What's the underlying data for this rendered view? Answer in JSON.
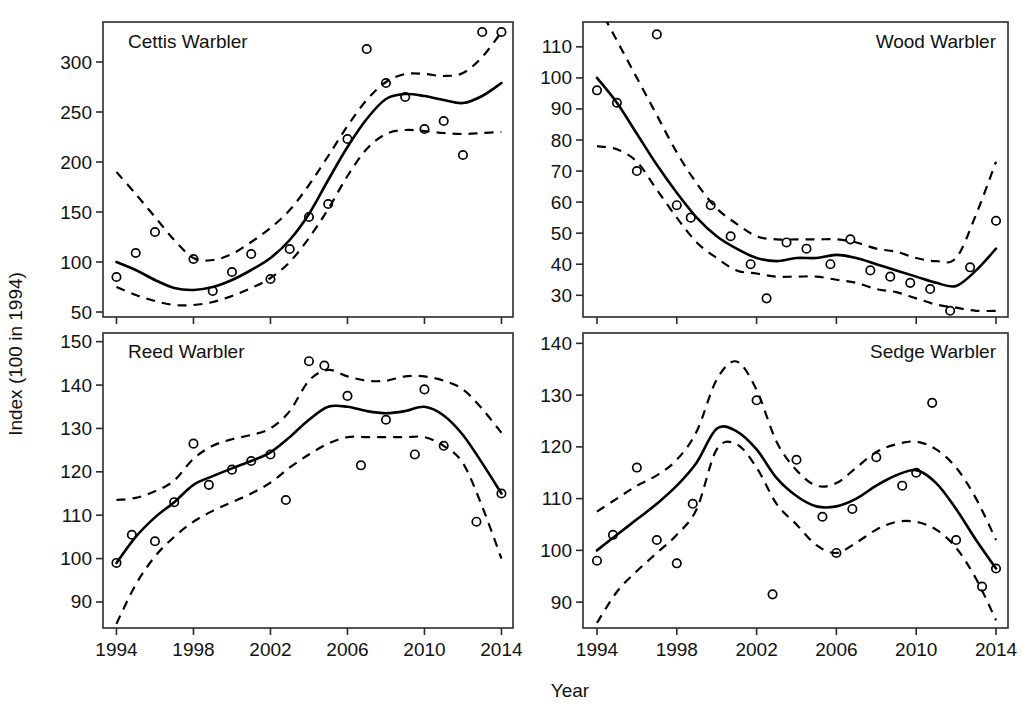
{
  "figure": {
    "xlabel": "Year",
    "ylabel": "Index (100 in 1994)",
    "background": "#ffffff",
    "line_color": "#000000",
    "point_face_color": "#ffffff"
  },
  "chart_data": [
    {
      "type": "line",
      "title": "Cettis Warbler",
      "panel": "top-left",
      "xlabel": "Year",
      "ylabel": "Index (100 in 1994)",
      "xlim": [
        1993.3,
        2014.6
      ],
      "ylim": [
        45,
        340
      ],
      "xticks": [
        1994,
        1998,
        2002,
        2006,
        2010,
        2014
      ],
      "xticklabels": [
        "1994",
        "1998",
        "2002",
        "2006",
        "2010",
        "2014"
      ],
      "yticks": [
        50,
        100,
        150,
        200,
        250,
        300
      ],
      "yticklabels": [
        "50",
        "100",
        "150",
        "200",
        "250",
        "300"
      ],
      "grid": false,
      "legend": "none",
      "series": [
        {
          "name": "observed index",
          "style": "open-circle-markers",
          "x": [
            1994,
            1995,
            1996,
            1998,
            1999,
            2000,
            2001,
            2002,
            2003,
            2004,
            2005,
            2006,
            2007,
            2008,
            2009,
            2010,
            2011,
            2012,
            2013,
            2014
          ],
          "values": [
            85,
            109,
            130,
            103,
            71,
            90,
            108,
            83,
            113,
            145,
            158,
            223,
            313,
            279,
            265,
            233,
            241,
            207,
            330,
            330
          ]
        },
        {
          "name": "smoothed trend",
          "style": "solid-line",
          "x": [
            1994,
            1995,
            1996,
            1997,
            1998,
            1999,
            2000,
            2001,
            2002,
            2003,
            2004,
            2005,
            2006,
            2007,
            2008,
            2009,
            2010,
            2011,
            2012,
            2013,
            2014
          ],
          "values": [
            100,
            92,
            82,
            74,
            72,
            75,
            82,
            92,
            104,
            122,
            148,
            182,
            215,
            243,
            263,
            268,
            266,
            262,
            259,
            266,
            279
          ]
        },
        {
          "name": "upper 95% confidence limit",
          "style": "dashed-line",
          "x": [
            1994,
            1995,
            1996,
            1997,
            1998,
            1999,
            2000,
            2001,
            2002,
            2003,
            2004,
            2005,
            2006,
            2007,
            2008,
            2009,
            2010,
            2011,
            2012,
            2013,
            2014
          ],
          "values": [
            190,
            168,
            145,
            122,
            104,
            102,
            108,
            120,
            134,
            152,
            177,
            206,
            236,
            262,
            280,
            288,
            288,
            286,
            289,
            305,
            330
          ]
        },
        {
          "name": "lower 95% confidence limit",
          "style": "dashed-line",
          "x": [
            1994,
            1995,
            1996,
            1997,
            1998,
            1999,
            2000,
            2001,
            2002,
            2003,
            2004,
            2005,
            2006,
            2007,
            2008,
            2009,
            2010,
            2011,
            2012,
            2013,
            2014
          ],
          "values": [
            75,
            67,
            61,
            57,
            57,
            60,
            66,
            74,
            84,
            100,
            124,
            153,
            186,
            213,
            228,
            232,
            231,
            229,
            228,
            229,
            230
          ]
        }
      ]
    },
    {
      "type": "line",
      "title": "Wood Warbler",
      "panel": "top-right",
      "xlabel": "Year",
      "ylabel": "Index (100 in 1994)",
      "xlim": [
        1993.3,
        2014.6
      ],
      "ylim": [
        23,
        118
      ],
      "xticks": [
        1994,
        1998,
        2002,
        2006,
        2010,
        2014
      ],
      "xticklabels": [
        "1994",
        "1998",
        "2002",
        "2006",
        "2010",
        "2014"
      ],
      "yticks": [
        30,
        40,
        50,
        60,
        70,
        80,
        90,
        100,
        110
      ],
      "yticklabels": [
        "30",
        "40",
        "50",
        "60",
        "70",
        "80",
        "90",
        "100",
        "110"
      ],
      "grid": false,
      "legend": "none",
      "series": [
        {
          "name": "observed index",
          "style": "open-circle-markers",
          "x": [
            1994,
            1995,
            1996,
            1997,
            1998,
            1998.7,
            1999.7,
            2000.7,
            2001.7,
            2002.5,
            2003.5,
            2004.5,
            2005.7,
            2006.7,
            2007.7,
            2008.7,
            2009.7,
            2010.7,
            2011.7,
            2012.7,
            2014
          ],
          "values": [
            96,
            92,
            70,
            114,
            59,
            55,
            59,
            49,
            40,
            29,
            47,
            45,
            40,
            48,
            38,
            36,
            34,
            32,
            25,
            39,
            54
          ]
        },
        {
          "name": "smoothed trend",
          "style": "solid-line",
          "x": [
            1994,
            1995,
            1996,
            1997,
            1998,
            1999,
            2000,
            2001,
            2002,
            2003,
            2004,
            2005,
            2006,
            2007,
            2008,
            2009,
            2010,
            2011,
            2012,
            2013,
            2014
          ],
          "values": [
            100,
            92,
            82,
            72,
            63,
            55,
            49,
            45,
            42,
            41,
            42,
            42,
            43,
            42,
            40,
            38,
            36,
            34,
            33,
            38,
            45
          ]
        },
        {
          "name": "upper 95% confidence limit",
          "style": "dashed-line",
          "x": [
            1994,
            1995,
            1996,
            1997,
            1998,
            1999,
            2000,
            2001,
            2002,
            2003,
            2004,
            2005,
            2006,
            2007,
            2008,
            2009,
            2010,
            2011,
            2012,
            2013,
            2014
          ],
          "values": [
            124,
            112,
            100,
            88,
            76,
            66,
            58,
            53,
            49,
            48,
            48,
            48,
            48,
            47,
            45,
            44,
            42,
            41,
            42,
            56,
            73
          ]
        },
        {
          "name": "lower 95% confidence limit",
          "style": "dashed-line",
          "x": [
            1994,
            1995,
            1996,
            1997,
            1998,
            1999,
            2000,
            2001,
            2002,
            2003,
            2004,
            2005,
            2006,
            2007,
            2008,
            2009,
            2010,
            2011,
            2012,
            2013,
            2014
          ],
          "values": [
            78,
            77,
            73,
            64,
            55,
            47,
            42,
            38,
            37,
            36,
            36,
            36,
            35,
            34,
            32,
            31,
            29,
            27,
            26,
            25,
            25
          ]
        }
      ]
    },
    {
      "type": "line",
      "title": "Reed Warbler",
      "panel": "bottom-left",
      "xlabel": "Year",
      "ylabel": "Index (100 in 1994)",
      "xlim": [
        1993.3,
        2014.6
      ],
      "ylim": [
        84,
        152
      ],
      "xticks": [
        1994,
        1998,
        2002,
        2006,
        2010,
        2014
      ],
      "xticklabels": [
        "1994",
        "1998",
        "2002",
        "2006",
        "2010",
        "2014"
      ],
      "yticks": [
        90,
        100,
        110,
        120,
        130,
        140,
        150
      ],
      "yticklabels": [
        "90",
        "100",
        "110",
        "120",
        "130",
        "140",
        "150"
      ],
      "grid": false,
      "legend": "none",
      "series": [
        {
          "name": "observed index",
          "style": "open-circle-markers",
          "x": [
            1994,
            1994.8,
            1996,
            1997,
            1998,
            1998.8,
            2000,
            2001,
            2002,
            2002.8,
            2004,
            2004.8,
            2006,
            2006.7,
            2008,
            2009.5,
            2010,
            2011,
            2012.7,
            2014
          ],
          "values": [
            99,
            105.5,
            104,
            113,
            126.5,
            117,
            120.5,
            122.5,
            124,
            113.5,
            145.5,
            144.5,
            137.5,
            121.5,
            132,
            124,
            139,
            126,
            108.5,
            115
          ]
        },
        {
          "name": "smoothed trend",
          "style": "solid-line",
          "x": [
            1994,
            1995,
            1996,
            1997,
            1998,
            1999,
            2000,
            2001,
            2002,
            2003,
            2004,
            2005,
            2006,
            2007,
            2008,
            2009,
            2010,
            2011,
            2012,
            2013,
            2014
          ],
          "values": [
            99,
            105,
            109.5,
            113,
            117,
            119,
            120.8,
            122.5,
            124.5,
            128,
            132,
            135,
            135,
            134,
            133.5,
            134,
            135,
            133,
            128.5,
            122,
            115
          ]
        },
        {
          "name": "upper 95% confidence limit",
          "style": "dashed-line",
          "x": [
            1994,
            1995,
            1996,
            1997,
            1998,
            1999,
            2000,
            2001,
            2002,
            2003,
            2004,
            2005,
            2006,
            2007,
            2008,
            2009,
            2010,
            2011,
            2012,
            2013,
            2014
          ],
          "values": [
            113.5,
            114,
            115.5,
            118,
            123,
            126,
            127.5,
            128.5,
            130,
            134,
            141,
            143.5,
            142,
            141,
            141,
            142,
            142,
            141,
            139,
            134.5,
            129
          ]
        },
        {
          "name": "lower 95% confidence limit",
          "style": "dashed-line",
          "x": [
            1994,
            1995,
            1996,
            1997,
            1998,
            1999,
            2000,
            2001,
            2002,
            2003,
            2004,
            2005,
            2006,
            2007,
            2008,
            2009,
            2010,
            2011,
            2012,
            2013,
            2014
          ],
          "values": [
            85,
            94,
            100.5,
            105,
            108.5,
            111,
            113,
            115,
            117.5,
            121,
            124,
            126.5,
            128,
            128,
            128,
            128,
            128,
            126,
            122,
            112,
            100
          ]
        }
      ]
    },
    {
      "type": "line",
      "title": "Sedge Warbler",
      "panel": "bottom-right",
      "xlabel": "Year",
      "ylabel": "Index (100 in 1994)",
      "xlim": [
        1993.3,
        2014.6
      ],
      "ylim": [
        85,
        142
      ],
      "xticks": [
        1994,
        1998,
        2002,
        2006,
        2010,
        2014
      ],
      "xticklabels": [
        "1994",
        "1998",
        "2002",
        "2006",
        "2010",
        "2014"
      ],
      "yticks": [
        90,
        100,
        110,
        120,
        130,
        140
      ],
      "yticklabels": [
        "90",
        "100",
        "110",
        "120",
        "130",
        "140"
      ],
      "grid": false,
      "legend": "none",
      "series": [
        {
          "name": "observed index",
          "style": "open-circle-markers",
          "x": [
            1994,
            1994.8,
            1996,
            1997,
            1998,
            1998.8,
            2002,
            2002.8,
            2004,
            2005.3,
            2006,
            2006.8,
            2008,
            2009.3,
            2010,
            2010.8,
            2012,
            2013.3,
            2014
          ],
          "values": [
            98,
            103,
            116,
            102,
            97.5,
            109,
            129,
            91.5,
            117.5,
            106.5,
            99.5,
            108,
            118,
            112.5,
            115,
            128.5,
            102,
            93,
            96.5
          ]
        },
        {
          "name": "smoothed trend",
          "style": "solid-line",
          "x": [
            1994,
            1995,
            1996,
            1997,
            1998,
            1999,
            2000,
            2001,
            2002,
            2003,
            2004,
            2005,
            2006,
            2007,
            2008,
            2009,
            2010,
            2011,
            2012,
            2013,
            2014
          ],
          "values": [
            100,
            103,
            106,
            109,
            112.5,
            117,
            123.5,
            123,
            119.5,
            114,
            110.5,
            108.5,
            108.5,
            110,
            112.5,
            114.5,
            115.5,
            113,
            108,
            102,
            96.5
          ]
        },
        {
          "name": "upper 95% confidence limit",
          "style": "dashed-line",
          "x": [
            1994,
            1995,
            1996,
            1997,
            1998,
            1999,
            2000,
            2001,
            2002,
            2003,
            2004,
            2005,
            2006,
            2007,
            2008,
            2009,
            2010,
            2011,
            2012,
            2013,
            2014
          ],
          "values": [
            107.5,
            110,
            112.5,
            114.5,
            117.5,
            123,
            133,
            136.5,
            131,
            121,
            115.5,
            112.5,
            113,
            116,
            119,
            120.5,
            121,
            119.5,
            116,
            110,
            102
          ]
        },
        {
          "name": "lower 95% confidence limit",
          "style": "dashed-line",
          "x": [
            1994,
            1995,
            1996,
            1997,
            1998,
            1999,
            2000,
            2001,
            2002,
            2003,
            2004,
            2005,
            2006,
            2007,
            2008,
            2009,
            2010,
            2011,
            2012,
            2013,
            2014
          ],
          "values": [
            86,
            92,
            96,
            99.5,
            103,
            108,
            119.5,
            120.5,
            116,
            109,
            105,
            101,
            99.5,
            101.5,
            104,
            105.5,
            105.5,
            104,
            100.5,
            94.5,
            86.5
          ]
        }
      ]
    }
  ]
}
